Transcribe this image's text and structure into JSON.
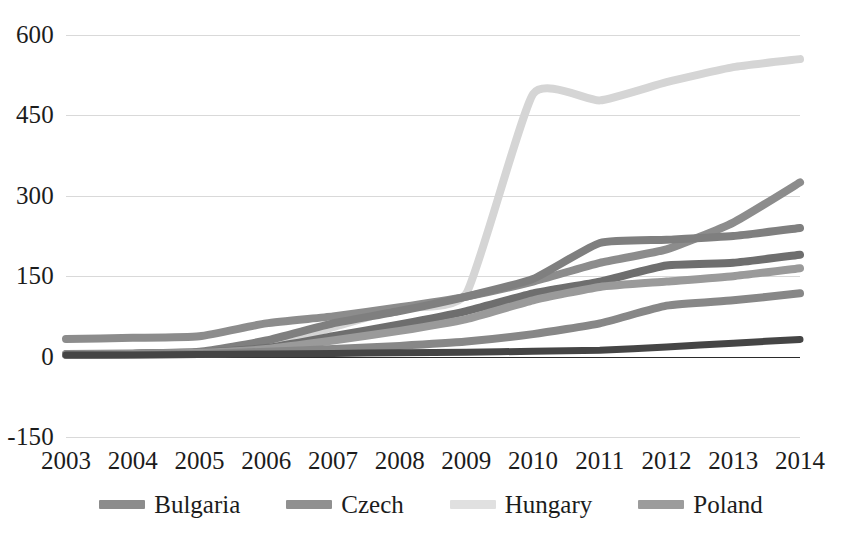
{
  "chart_data": {
    "type": "line",
    "title": "",
    "subtitle": "",
    "xlabel": "",
    "ylabel": "",
    "grid": true,
    "legend_position": "bottom",
    "x": [
      2003,
      2004,
      2005,
      2006,
      2007,
      2008,
      2009,
      2010,
      2011,
      2012,
      2013,
      2014
    ],
    "xtick_labels": [
      "2003",
      "2004",
      "2005",
      "2006",
      "2007",
      "2008",
      "2009",
      "2010",
      "2011",
      "2012",
      "2013",
      "2014"
    ],
    "ytick_labels": [
      "600",
      "450",
      "300",
      "150",
      "0",
      "-150"
    ],
    "yticks": [
      600,
      450,
      300,
      150,
      0,
      -150
    ],
    "ylim": [
      -150,
      600
    ],
    "xlim": [
      2003,
      2014
    ],
    "series": [
      {
        "name": "Hungary",
        "color": "#d5d5d5",
        "values": [
          4,
          5,
          8,
          20,
          55,
          90,
          118,
          490,
          478,
          512,
          540,
          555
        ]
      },
      {
        "name": "Series-2",
        "color": "#8c8c8c",
        "values": [
          33,
          35,
          38,
          62,
          75,
          92,
          112,
          140,
          175,
          200,
          250,
          325
        ]
      },
      {
        "name": "Bulgaria",
        "color": "#7f7f7f",
        "values": [
          5,
          6,
          9,
          30,
          62,
          85,
          112,
          145,
          212,
          218,
          225,
          240
        ]
      },
      {
        "name": "Czech",
        "color": "#6e6e6e",
        "values": [
          4,
          5,
          7,
          16,
          38,
          60,
          85,
          118,
          140,
          170,
          175,
          190
        ]
      },
      {
        "name": "Series-5",
        "color": "#9a9a9a",
        "values": [
          4,
          5,
          7,
          14,
          30,
          48,
          70,
          105,
          130,
          140,
          150,
          165
        ]
      },
      {
        "name": "Poland",
        "color": "#878787",
        "values": [
          3,
          4,
          5,
          9,
          14,
          20,
          28,
          42,
          62,
          95,
          105,
          118
        ]
      },
      {
        "name": "Series-7",
        "color": "#454545",
        "values": [
          3,
          3,
          4,
          5,
          6,
          7,
          8,
          10,
          12,
          18,
          25,
          32
        ]
      }
    ]
  },
  "legend": {
    "items": [
      {
        "label": "Bulgaria",
        "color": "#8c8c8c"
      },
      {
        "label": "Czech",
        "color": "#909090"
      },
      {
        "label": "Hungary",
        "color": "#e0e0e0"
      },
      {
        "label": "Poland",
        "color": "#9c9c9c"
      }
    ]
  },
  "axes": {
    "y_ticks": [
      "600",
      "450",
      "300",
      "150",
      "0",
      "-150"
    ],
    "x_ticks": [
      "2003",
      "2004",
      "2005",
      "2006",
      "2007",
      "2008",
      "2009",
      "2010",
      "2011",
      "2012",
      "2013",
      "2014"
    ]
  },
  "colors": {
    "gridline": "#d9d9d9",
    "axis": "#2b2b2b",
    "text": "#1c1c1c",
    "background": "#ffffff"
  }
}
